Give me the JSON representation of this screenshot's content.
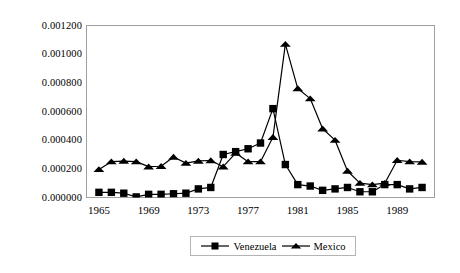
{
  "chart_data": {
    "type": "line",
    "title": "",
    "subtitle": "",
    "xlabel": "",
    "ylabel": "",
    "grid": false,
    "legend_position": "bottom",
    "xlim": [
      1964,
      1992
    ],
    "ylim": [
      0.0,
      0.0012
    ],
    "x": [
      1965,
      1966,
      1967,
      1968,
      1969,
      1970,
      1971,
      1972,
      1973,
      1974,
      1975,
      1976,
      1977,
      1978,
      1979,
      1980,
      1981,
      1982,
      1983,
      1984,
      1985,
      1986,
      1987,
      1988,
      1989,
      1990,
      1991
    ],
    "xticks": [
      1965,
      1969,
      1973,
      1977,
      1981,
      1985,
      1989
    ],
    "xtick_labels": [
      "1965",
      "1969",
      "1973",
      "1977",
      "1981",
      "1985",
      "1989"
    ],
    "yticks": [
      0.0,
      0.0002,
      0.0004,
      0.0006,
      0.0008,
      0.001,
      0.0012
    ],
    "ytick_labels": [
      "0.000000",
      "0.000200",
      "0.000400",
      "0.000600",
      "0.000800",
      "0.001000",
      "0.001200"
    ],
    "series": [
      {
        "name": "Venezuela",
        "marker": "square",
        "color": "#000000",
        "values": [
          3.6e-05,
          3.6e-05,
          3e-05,
          4e-06,
          2.2e-05,
          2.2e-05,
          2.6e-05,
          3e-05,
          6e-05,
          7e-05,
          0.0003,
          0.00032,
          0.00034,
          0.00038,
          0.00062,
          0.00023,
          9e-05,
          8e-05,
          5e-05,
          6e-05,
          7e-05,
          4e-05,
          4e-05,
          9e-05,
          9e-05,
          6e-05,
          7e-05
        ]
      },
      {
        "name": "Mexico",
        "marker": "triangle",
        "color": "#000000",
        "values": [
          0.000196,
          0.00025,
          0.000254,
          0.00025,
          0.000215,
          0.000218,
          0.000282,
          0.00024,
          0.000255,
          0.000258,
          0.000215,
          0.00031,
          0.00025,
          0.00025,
          0.00042,
          0.00107,
          0.00076,
          0.00069,
          0.00048,
          0.0004,
          0.000185,
          0.0001,
          9e-05,
          0.0001,
          0.00026,
          0.00025,
          0.000248
        ]
      }
    ]
  },
  "legend": {
    "items": [
      {
        "label": "Venezuela",
        "marker": "square"
      },
      {
        "label": "Mexico",
        "marker": "triangle"
      }
    ]
  },
  "axes": {
    "frame_color": "#a0a0a0"
  }
}
